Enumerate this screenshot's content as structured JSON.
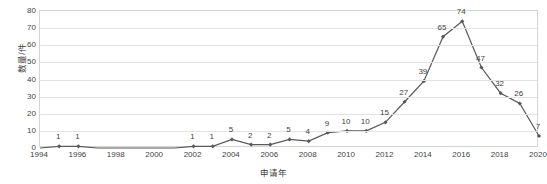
{
  "chart_data": {
    "type": "line",
    "title": "",
    "xlabel": "申请年",
    "ylabel": "数量/件",
    "xlim": [
      1994,
      2020
    ],
    "ylim": [
      0,
      80
    ],
    "ytick_step": 10,
    "yticks": [
      "0",
      "10",
      "20",
      "30",
      "40",
      "50",
      "60",
      "70",
      "80"
    ],
    "xticks": [
      "1994",
      "1996",
      "1998",
      "2000",
      "2002",
      "2004",
      "2006",
      "2008",
      "2010",
      "2012",
      "2014",
      "2016",
      "2018",
      "2020"
    ],
    "grid": true,
    "legend": "none",
    "series_color": "#595959",
    "marker": "diamond",
    "x": [
      1994,
      1995,
      1996,
      1997,
      1998,
      1999,
      2000,
      2001,
      2002,
      2003,
      2004,
      2005,
      2006,
      2007,
      2008,
      2009,
      2010,
      2011,
      2012,
      2013,
      2014,
      2015,
      2016,
      2017,
      2018,
      2019,
      2020
    ],
    "values": [
      0,
      1,
      1,
      0,
      0,
      0,
      0,
      0,
      1,
      1,
      5,
      2,
      2,
      5,
      4,
      9,
      10,
      10,
      15,
      27,
      39,
      65,
      74,
      47,
      32,
      26,
      7
    ],
    "point_labels": [
      {
        "x": 1995,
        "y": 1,
        "text": "1"
      },
      {
        "x": 1996,
        "y": 1,
        "text": "1"
      },
      {
        "x": 2002,
        "y": 1,
        "text": "1"
      },
      {
        "x": 2003,
        "y": 1,
        "text": "1"
      },
      {
        "x": 2004,
        "y": 5,
        "text": "5"
      },
      {
        "x": 2005,
        "y": 2,
        "text": "2"
      },
      {
        "x": 2006,
        "y": 2,
        "text": "2"
      },
      {
        "x": 2007,
        "y": 5,
        "text": "5"
      },
      {
        "x": 2008,
        "y": 4,
        "text": "4"
      },
      {
        "x": 2009,
        "y": 9,
        "text": "9"
      },
      {
        "x": 2010,
        "y": 10,
        "text": "10"
      },
      {
        "x": 2011,
        "y": 10,
        "text": "10"
      },
      {
        "x": 2012,
        "y": 15,
        "text": "15"
      },
      {
        "x": 2013,
        "y": 27,
        "text": "27"
      },
      {
        "x": 2014,
        "y": 39,
        "text": "39"
      },
      {
        "x": 2015,
        "y": 65,
        "text": "65"
      },
      {
        "x": 2016,
        "y": 74,
        "text": "74"
      },
      {
        "x": 2017,
        "y": 47,
        "text": "47"
      },
      {
        "x": 2018,
        "y": 32,
        "text": "32"
      },
      {
        "x": 2019,
        "y": 26,
        "text": "26"
      },
      {
        "x": 2020,
        "y": 7,
        "text": "7"
      }
    ]
  }
}
